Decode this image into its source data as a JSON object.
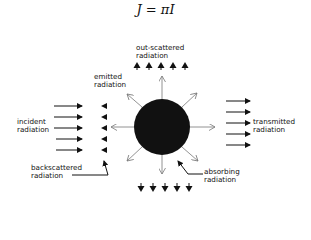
{
  "formula": "J = πI",
  "labels": {
    "out_scattered": [
      "out-scattered",
      "radiation"
    ],
    "emitted": [
      "emitted",
      "radiation"
    ],
    "incident": [
      "incident",
      "radiation"
    ],
    "transmitted": [
      "transmitted",
      "radiation"
    ],
    "backscattered": [
      "backscattered",
      "radiation"
    ],
    "absorbing": [
      "absorbing",
      "radiation"
    ]
  },
  "colors": {
    "ink": "#111111",
    "thin_arrow": "#777777",
    "background": "#ffffff"
  },
  "counts": {
    "incident_arrows": 5,
    "backscattered_arrows": 5,
    "transmitted_arrows": 5,
    "out_scattered_arrows": 5,
    "down_scattered_arrows": 5,
    "emitted_arrows": 8
  }
}
